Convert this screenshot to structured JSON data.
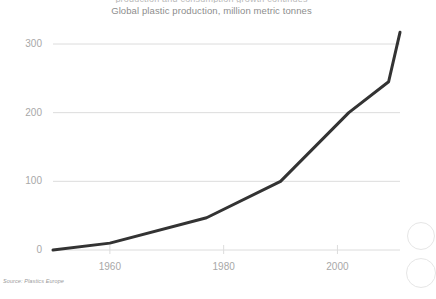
{
  "top_crop_text": "production and consumption growth continues",
  "source_note": "Source: Plastics Europe",
  "chart_data": {
    "type": "line",
    "title": "",
    "subtitle": "Global plastic production, million metric tonnes",
    "xlabel": "",
    "ylabel": "",
    "xlim": [
      1950,
      2011
    ],
    "ylim": [
      0,
      320
    ],
    "xticks": [
      1960,
      1980,
      2000
    ],
    "xtick_labels": [
      "1960",
      "1980",
      "2000"
    ],
    "yticks": [
      0,
      100,
      200,
      300
    ],
    "ytick_labels": [
      "0",
      "100",
      "200",
      "300"
    ],
    "grid": true,
    "grid_axis": "y",
    "legend": false,
    "line_color": "#333333",
    "line_width": 3,
    "grid_color": "#dcdcdc",
    "tick_color": "#a8a8a8",
    "series": [
      {
        "name": "Global plastic production",
        "x": [
          1950,
          1960,
          1977,
          1990,
          2002,
          2009,
          2011
        ],
        "values": [
          0,
          10,
          47,
          100,
          200,
          245,
          317
        ]
      }
    ]
  }
}
